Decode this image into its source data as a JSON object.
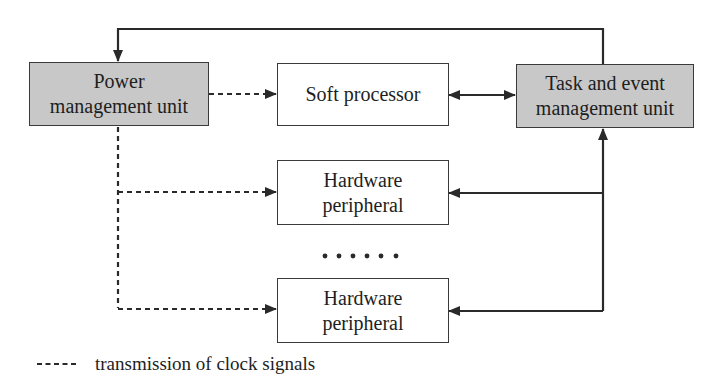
{
  "diagram": {
    "type": "block-diagram",
    "nodes": {
      "power_management_unit": {
        "label_line1": "Power",
        "label_line2": "management unit",
        "fill": "#c8c8c8"
      },
      "soft_processor": {
        "label": "Soft processor",
        "fill": "#ffffff"
      },
      "task_event_unit": {
        "label_line1": "Task and event",
        "label_line2": "management unit",
        "fill": "#c8c8c8"
      },
      "hardware_peripheral_1": {
        "label_line1": "Hardware",
        "label_line2": "peripheral",
        "fill": "#ffffff"
      },
      "hardware_peripheral_2": {
        "label_line1": "Hardware",
        "label_line2": "peripheral",
        "fill": "#ffffff"
      }
    },
    "ellipsis": "......",
    "edges": [
      {
        "from": "task_event_unit",
        "to": "power_management_unit",
        "style": "solid",
        "route": "top-loop"
      },
      {
        "from": "power_management_unit",
        "to": "soft_processor",
        "style": "dashed"
      },
      {
        "from": "power_management_unit",
        "to": "hardware_peripheral_1",
        "style": "dashed"
      },
      {
        "from": "power_management_unit",
        "to": "hardware_peripheral_2",
        "style": "dashed"
      },
      {
        "from": "soft_processor",
        "to": "task_event_unit",
        "style": "solid",
        "bidirectional": true
      },
      {
        "from": "task_event_unit",
        "to": "hardware_peripheral_1",
        "style": "solid",
        "bidirectional": true
      },
      {
        "from": "task_event_unit",
        "to": "hardware_peripheral_2",
        "style": "solid",
        "bidirectional": true
      }
    ],
    "legend": {
      "dashed_line": "transmission of clock signals"
    },
    "colors": {
      "line": "#2a2a2a",
      "shaded_box": "#c8c8c8",
      "border": "#3a3a3a"
    }
  }
}
